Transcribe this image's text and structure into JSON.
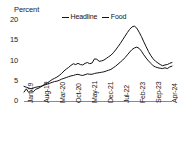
{
  "chart_data": {
    "type": "line",
    "title": "",
    "xlabel": "",
    "ylabel": "Percent",
    "ylim": [
      0,
      20
    ],
    "yticks": [
      0,
      5,
      10,
      15,
      20
    ],
    "grid": false,
    "legend_position": "top-center",
    "xtick_labels": [
      "Jan-19",
      "Aug-19",
      "Mar-20",
      "Oct-20",
      "May-21",
      "Dec-21",
      "Jul-22",
      "Feb-23",
      "Sep-23",
      "Apr-24"
    ],
    "x": [
      "Jan-19",
      "Feb-19",
      "Mar-19",
      "Apr-19",
      "May-19",
      "Jun-19",
      "Jul-19",
      "Aug-19",
      "Sep-19",
      "Oct-19",
      "Nov-19",
      "Dec-19",
      "Jan-20",
      "Feb-20",
      "Mar-20",
      "Apr-20",
      "May-20",
      "Jun-20",
      "Jul-20",
      "Aug-20",
      "Sep-20",
      "Oct-20",
      "Nov-20",
      "Dec-20",
      "Jan-21",
      "Feb-21",
      "Mar-21",
      "Apr-21",
      "May-21",
      "Jun-21",
      "Jul-21",
      "Aug-21",
      "Sep-21",
      "Oct-21",
      "Nov-21",
      "Dec-21",
      "Jan-22",
      "Feb-22",
      "Mar-22",
      "Apr-22",
      "May-22",
      "Jun-22",
      "Jul-22",
      "Aug-22",
      "Sep-22",
      "Oct-22",
      "Nov-22",
      "Dec-22",
      "Jan-23",
      "Feb-23",
      "Mar-23",
      "Apr-23",
      "May-23",
      "Jun-23",
      "Jul-23",
      "Aug-23",
      "Sep-23",
      "Oct-23",
      "Nov-23",
      "Dec-23",
      "Jan-24",
      "Feb-24",
      "Mar-24",
      "Apr-24"
    ],
    "series": [
      {
        "name": "Headline",
        "color": "#111111",
        "values": [
          3.6,
          3.4,
          3.2,
          3.0,
          3.2,
          3.4,
          3.5,
          3.6,
          3.8,
          4.0,
          4.2,
          4.4,
          4.6,
          4.8,
          4.9,
          5.1,
          5.4,
          5.6,
          5.8,
          6.0,
          6.2,
          6.3,
          6.5,
          6.6,
          6.4,
          6.3,
          6.5,
          6.7,
          6.6,
          6.6,
          6.8,
          6.9,
          7.0,
          7.1,
          7.2,
          7.4,
          7.6,
          7.8,
          8.2,
          8.6,
          9.1,
          9.6,
          10.1,
          10.7,
          11.4,
          12.1,
          12.7,
          13.1,
          13.3,
          13.0,
          12.3,
          11.4,
          10.6,
          9.9,
          9.3,
          8.7,
          8.4,
          8.2,
          8.1,
          8.0,
          8.2,
          8.0,
          8.4,
          8.6
        ],
        "marker": "none",
        "linewidth": 1.0
      },
      {
        "name": "Food",
        "color": "#111111",
        "values": [
          2.2,
          3.0,
          2.1,
          2.6,
          2.3,
          2.9,
          3.1,
          3.4,
          3.8,
          4.2,
          4.5,
          4.9,
          5.3,
          5.6,
          5.9,
          6.3,
          6.8,
          7.4,
          7.9,
          8.3,
          8.8,
          9.2,
          9.0,
          9.3,
          9.0,
          8.9,
          9.3,
          9.5,
          9.2,
          9.4,
          10.4,
          10.3,
          9.8,
          9.9,
          10.1,
          10.5,
          10.9,
          11.3,
          11.9,
          12.6,
          13.4,
          14.2,
          15.1,
          16.0,
          16.9,
          17.7,
          18.3,
          18.5,
          18.0,
          17.0,
          15.9,
          14.6,
          13.4,
          12.2,
          11.2,
          10.4,
          9.8,
          9.4,
          9.0,
          8.7,
          8.9,
          9.0,
          9.3,
          9.5
        ],
        "marker": "none",
        "linewidth": 1.0
      }
    ]
  },
  "axis": {
    "y_title": "Percent"
  },
  "legend": {
    "items": [
      {
        "label": "Headline",
        "marker": "line-marker"
      },
      {
        "label": "Food",
        "marker": "line-marker"
      }
    ]
  }
}
